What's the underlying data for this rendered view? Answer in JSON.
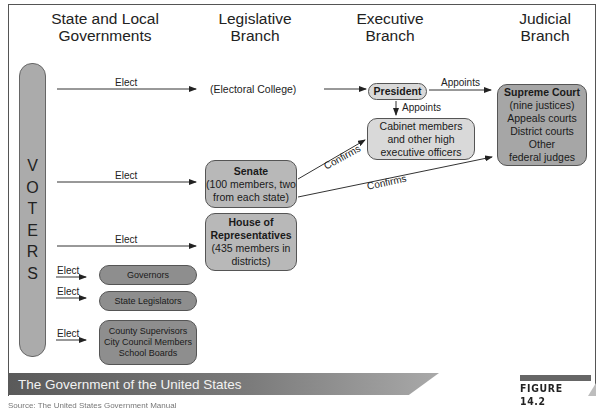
{
  "columns": {
    "state_local": "State and Local Governments",
    "legislative": "Legislative Branch",
    "executive": "Executive Branch",
    "judicial": "Judicial Branch"
  },
  "voters": {
    "letters": [
      "V",
      "O",
      "T",
      "E",
      "R",
      "S"
    ]
  },
  "edges": {
    "elect_electoral": "Elect",
    "elect_senate": "Elect",
    "elect_house": "Elect",
    "elect_governors": "Elect",
    "elect_state_legislators": "Elect",
    "elect_local": "Elect",
    "appoints_court": "Appoints",
    "appoints_cabinet": "Appoints",
    "confirms_cabinet": "Confirms",
    "confirms_court": "Confirms"
  },
  "nodes": {
    "electoral_college": "(Electoral College)",
    "president": "President",
    "cabinet": "Cabinet members and other high executive officers",
    "supreme_court": {
      "title": "Supreme Court",
      "lines": [
        "(nine justices)",
        "Appeals courts",
        "District courts",
        "Other",
        "federal judges"
      ]
    },
    "senate": {
      "title": "Senate",
      "detail": "(100 members, two from each state)"
    },
    "house": {
      "title": "House of Representatives",
      "detail": "(435 members in districts)"
    },
    "governors": "Governors",
    "state_legislators": "State Legislators",
    "local": [
      "County Supervisors",
      "City Council Members",
      "School Boards"
    ]
  },
  "caption": {
    "title": "The Government of the United States",
    "figure": "FIGURE 14.2",
    "source": "Source: The United States Government Manual"
  },
  "colors": {
    "box_mid": "#b8b8b8",
    "box_light": "#d9d9d9",
    "box_dark": "#8e8e8e",
    "banner": "#6a6a6a"
  }
}
